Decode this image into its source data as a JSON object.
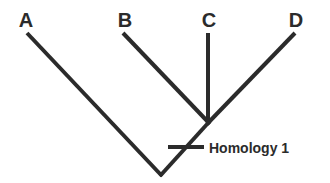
{
  "diagram": {
    "type": "cladogram",
    "taxa": [
      {
        "id": "A",
        "label": "A"
      },
      {
        "id": "B",
        "label": "B"
      },
      {
        "id": "C",
        "label": "C"
      },
      {
        "id": "D",
        "label": "D"
      }
    ],
    "clades": [
      {
        "id": "root",
        "members": [
          "A",
          "BCD"
        ]
      },
      {
        "id": "BCD",
        "members": [
          "B",
          "C",
          "D"
        ]
      }
    ],
    "characters": [
      {
        "id": "homology-1",
        "label": "Homology 1",
        "on_branch": "BCD"
      }
    ],
    "colors": {
      "ink": "#2b2b2b",
      "background": "#ffffff"
    }
  }
}
